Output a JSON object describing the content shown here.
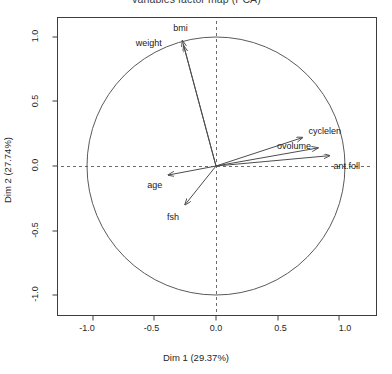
{
  "chart_data": {
    "type": "scatter",
    "subtype": "pca-correlation-circle",
    "title": "Variables factor map (PCA)",
    "xlabel": "Dim 1 (29.37%)",
    "ylabel": "Dim 2 (27.74%)",
    "xlim": [
      -1.15,
      1.15
    ],
    "ylim": [
      -1.15,
      1.15
    ],
    "grid": false,
    "legend": null,
    "reference_circle": {
      "radius": 1.0,
      "center": [
        0,
        0
      ],
      "color": "#555555"
    },
    "reference_lines": {
      "style": "dashed",
      "color": "#666666",
      "x": 0.0,
      "y": 0.0
    },
    "xticks": [
      "-1.0",
      "-0.5",
      "0.0",
      "0.5",
      "1.0"
    ],
    "xtick_values": [
      -1.0,
      -0.5,
      0.0,
      0.5,
      1.0
    ],
    "yticks": [
      "-1.0",
      "-0.5",
      "0.0",
      "0.5",
      "1.0"
    ],
    "ytick_values": [
      -1.0,
      -0.5,
      0.0,
      0.5,
      1.0
    ],
    "arrow_color": "#4d4d4d",
    "variables": [
      {
        "name": "bmi",
        "x": -0.26,
        "y": 0.97,
        "label_dx": -2,
        "label_dy": -12,
        "label_anchor": "middle"
      },
      {
        "name": "weight",
        "x": -0.25,
        "y": 0.93,
        "label_dx": -22,
        "label_dy": -2,
        "label_anchor": "end"
      },
      {
        "name": "cyclelen",
        "x": 0.67,
        "y": 0.22,
        "label_dx": 6,
        "label_dy": -6,
        "label_anchor": "start"
      },
      {
        "name": "ovolume",
        "x": 0.79,
        "y": 0.14,
        "label_dx": -24,
        "label_dy": -1,
        "label_anchor": "middle"
      },
      {
        "name": "ant.foll",
        "x": 0.88,
        "y": 0.08,
        "label_dx": 4,
        "label_dy": 11,
        "label_anchor": "start"
      },
      {
        "name": "age",
        "x": -0.37,
        "y": -0.07,
        "label_dx": -6,
        "label_dy": 11,
        "label_anchor": "end"
      },
      {
        "name": "fsh",
        "x": -0.24,
        "y": -0.3,
        "label_dx": -6,
        "label_dy": 13,
        "label_anchor": "end"
      }
    ]
  }
}
